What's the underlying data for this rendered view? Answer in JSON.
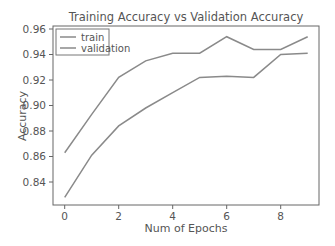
{
  "chart_data": {
    "type": "line",
    "title": "Training Accuracy vs Validation Accuracy",
    "xlabel": "Num of Epochs",
    "ylabel": "Accuracy",
    "x": [
      0,
      1,
      2,
      3,
      4,
      5,
      6,
      7,
      8,
      9
    ],
    "series": [
      {
        "name": "train",
        "values": [
          0.863,
          0.893,
          0.922,
          0.935,
          0.941,
          0.941,
          0.954,
          0.944,
          0.944,
          0.954
        ],
        "color": "#8a8a8a"
      },
      {
        "name": "validation",
        "values": [
          0.828,
          0.861,
          0.884,
          0.898,
          0.91,
          0.922,
          0.923,
          0.922,
          0.94,
          0.941
        ],
        "color": "#8a8a8a"
      }
    ],
    "xticks": [
      0,
      2,
      4,
      6,
      8
    ],
    "xtick_labels": [
      "0",
      "2",
      "4",
      "6",
      "8"
    ],
    "yticks": [
      0.84,
      0.86,
      0.88,
      0.9,
      0.92,
      0.94,
      0.96
    ],
    "ytick_labels": [
      "0.84",
      "0.86",
      "0.88",
      "0.90",
      "0.92",
      "0.94",
      "0.96"
    ],
    "xlim": [
      -0.45,
      9.45
    ],
    "ylim": [
      0.822,
      0.962
    ],
    "grid": false,
    "legend_position": "upper left"
  },
  "legend": {
    "items": [
      {
        "label": "train"
      },
      {
        "label": "validation"
      }
    ]
  }
}
